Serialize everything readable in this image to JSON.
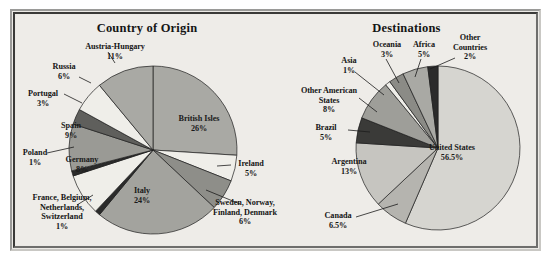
{
  "figure": {
    "background_color": "#eeece8",
    "frame_color": "#3a3a38"
  },
  "chart_data": [
    {
      "type": "pie",
      "title": "Country of Origin",
      "legend_position": "callout-labels",
      "categories": [
        "British Isles",
        "Ireland",
        "Sweden, Norway, Finland, Denmark",
        "Italy",
        "France, Belgium, Netherlands, Switzerland",
        "Germany",
        "Poland",
        "Spain",
        "Portugal",
        "Russia",
        "Austria-Hungary"
      ],
      "values": [
        26,
        5,
        6,
        24,
        1,
        8,
        1,
        9,
        3,
        6,
        11
      ],
      "value_labels": [
        "26%",
        "5%",
        "6%",
        "24%",
        "1%",
        "8%",
        "1%",
        "9%",
        "3%",
        "6%",
        "11%"
      ],
      "colors": [
        "#a9a9a4",
        "#efeee9",
        "#8e8e89",
        "#a3a39e",
        "#2b2b2b",
        "#efeee9",
        "#2b2b2b",
        "#9a9a95",
        "#5f5f5c",
        "#efeee9",
        "#a9a9a4"
      ],
      "xlabel": "",
      "ylabel": ""
    },
    {
      "type": "pie",
      "title": "Destinations",
      "legend_position": "callout-labels",
      "categories": [
        "United States",
        "Canada",
        "Argentina",
        "Brazil",
        "Other American States",
        "Asia",
        "Oceania",
        "Africa",
        "Other Countries"
      ],
      "values": [
        56.5,
        6.5,
        13,
        5,
        8,
        1,
        3,
        5,
        2
      ],
      "value_labels": [
        "56.5%",
        "6.5%",
        "13%",
        "5%",
        "8%",
        "1%",
        "3%",
        "5%",
        "2%"
      ],
      "colors": [
        "#d6d5d0",
        "#b5b4af",
        "#c6c5c0",
        "#3a3a38",
        "#9e9e99",
        "#efeee9",
        "#8b8b86",
        "#a9a9a4",
        "#2b2b2b"
      ],
      "xlabel": "",
      "ylabel": ""
    }
  ],
  "origin": {
    "title": "Country of Origin",
    "labels": {
      "british_isles": {
        "name": "British Isles",
        "pct": "26%"
      },
      "ireland": {
        "name": "Ireland",
        "pct": "5%"
      },
      "nordics_l1": {
        "name": "Sweden, Norway,",
        "l2": "Finland, Denmark",
        "pct": "6%"
      },
      "italy": {
        "name": "Italy",
        "pct": "24%"
      },
      "france_l1": {
        "name": "France, Belgium,",
        "l2": "Netherlands,",
        "l3": "Switzerland",
        "pct": "1%"
      },
      "germany": {
        "name": "Germany",
        "pct": "8%"
      },
      "poland": {
        "name": "Poland",
        "pct": "1%"
      },
      "spain": {
        "name": "Spain",
        "pct": "9%"
      },
      "portugal": {
        "name": "Portugal",
        "pct": "3%"
      },
      "russia": {
        "name": "Russia",
        "pct": "6%"
      },
      "austria": {
        "name": "Austria-Hungary",
        "pct": "11%"
      }
    }
  },
  "destinations": {
    "title": "Destinations",
    "labels": {
      "united_states": {
        "name": "United States",
        "pct": "56.5%"
      },
      "canada": {
        "name": "Canada",
        "pct": "6.5%"
      },
      "argentina": {
        "name": "Argentina",
        "pct": "13%"
      },
      "brazil": {
        "name": "Brazil",
        "pct": "5%"
      },
      "other_american_l1": {
        "name": "Other American",
        "l2": "States",
        "pct": "8%"
      },
      "asia": {
        "name": "Asia",
        "pct": "1%"
      },
      "oceania": {
        "name": "Oceania",
        "pct": "3%"
      },
      "africa": {
        "name": "Africa",
        "pct": "5%"
      },
      "other_countries_l1": {
        "name": "Other",
        "l2": "Countries",
        "pct": "2%"
      }
    }
  }
}
